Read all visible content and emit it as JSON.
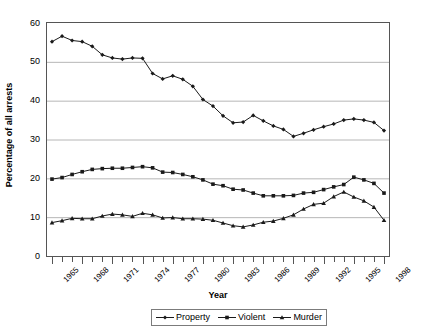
{
  "chart_data": {
    "type": "line",
    "title": "",
    "xlabel": "Year",
    "ylabel": "Percentage of all arrests",
    "xlim": [
      1965,
      1998
    ],
    "ylim": [
      0,
      60
    ],
    "grid": true,
    "legend_position": "bottom",
    "y_ticks": [
      0,
      10,
      20,
      30,
      40,
      50,
      60
    ],
    "y_tick_labels": [
      "0",
      "10",
      "20",
      "30",
      "40",
      "50",
      "60"
    ],
    "x_tick_labels": [
      "1965",
      "1968",
      "1971",
      "1974",
      "1977",
      "1980",
      "1983",
      "1986",
      "1989",
      "1992",
      "1995",
      "1998"
    ],
    "x": [
      1965,
      1966,
      1967,
      1968,
      1969,
      1970,
      1971,
      1972,
      1973,
      1974,
      1975,
      1976,
      1977,
      1978,
      1979,
      1980,
      1981,
      1982,
      1983,
      1984,
      1985,
      1986,
      1987,
      1988,
      1989,
      1990,
      1991,
      1992,
      1993,
      1994,
      1995,
      1996,
      1997,
      1998
    ],
    "series": [
      {
        "name": "Property",
        "marker": "diamond",
        "color": "#1a1a1a",
        "values": [
          55.2,
          56.6,
          55.5,
          55.2,
          54.0,
          51.8,
          51.0,
          50.7,
          51.0,
          50.9,
          47.0,
          45.6,
          46.4,
          45.5,
          43.7,
          40.3,
          38.6,
          36.1,
          34.3,
          34.5,
          36.2,
          34.8,
          33.5,
          32.6,
          30.8,
          31.6,
          32.5,
          33.3,
          34.0,
          35.0,
          35.3,
          35.0,
          34.4,
          32.3
        ]
      },
      {
        "name": "Violent",
        "marker": "square",
        "color": "#1a1a1a",
        "values": [
          19.8,
          20.2,
          21.0,
          21.7,
          22.3,
          22.5,
          22.6,
          22.6,
          22.8,
          23.0,
          22.7,
          21.6,
          21.5,
          21.0,
          20.4,
          19.6,
          18.5,
          18.1,
          17.2,
          17.0,
          16.2,
          15.5,
          15.5,
          15.5,
          15.6,
          16.2,
          16.4,
          17.1,
          17.8,
          18.4,
          20.3,
          19.6,
          18.7,
          16.2
        ]
      },
      {
        "name": "Murder",
        "marker": "triangle",
        "color": "#1a1a1a",
        "values": [
          8.6,
          9.1,
          9.7,
          9.6,
          9.6,
          10.3,
          10.8,
          10.6,
          10.2,
          11.0,
          10.6,
          9.8,
          9.9,
          9.6,
          9.6,
          9.5,
          9.2,
          8.5,
          7.8,
          7.5,
          8.0,
          8.7,
          9.0,
          9.7,
          10.6,
          12.1,
          13.3,
          13.6,
          15.3,
          16.5,
          15.2,
          14.2,
          12.6,
          9.2
        ]
      }
    ]
  }
}
